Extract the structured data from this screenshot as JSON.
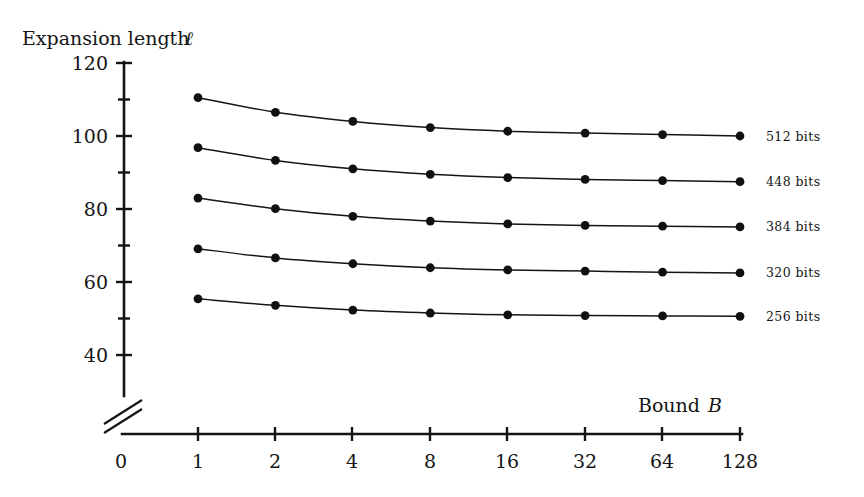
{
  "chart_data": {
    "type": "line",
    "title": "",
    "xlabel": "Bound B",
    "ylabel": "Expansion length ℓ",
    "x_scale": "log2",
    "x": [
      1,
      2,
      4,
      8,
      16,
      32,
      64,
      128
    ],
    "x_tick_labels": [
      "0",
      "1",
      "2",
      "4",
      "8",
      "16",
      "32",
      "64",
      "128"
    ],
    "y_tick_labels": [
      "120",
      "100",
      "80",
      "60",
      "40"
    ],
    "y_major_ticks": [
      40,
      60,
      80,
      100,
      120
    ],
    "y_minor_ticks": [
      50,
      70,
      90,
      110
    ],
    "ylim": [
      36,
      120
    ],
    "axis_break": true,
    "grid": false,
    "legend_position": "right",
    "series": [
      {
        "name": "512 bits",
        "values": [
          110.5,
          106.5,
          104.0,
          102.3,
          101.3,
          100.8,
          100.4,
          100.0
        ]
      },
      {
        "name": "448 bits",
        "values": [
          96.8,
          93.3,
          91.0,
          89.5,
          88.6,
          88.1,
          87.8,
          87.5
        ]
      },
      {
        "name": "384 bits",
        "values": [
          83.0,
          80.1,
          78.0,
          76.7,
          75.9,
          75.5,
          75.3,
          75.1
        ]
      },
      {
        "name": "320 bits",
        "values": [
          69.1,
          66.6,
          65.0,
          63.9,
          63.3,
          63.0,
          62.7,
          62.5
        ]
      },
      {
        "name": "256 bits",
        "values": [
          55.4,
          53.6,
          52.3,
          51.5,
          51.0,
          50.8,
          50.7,
          50.6
        ]
      }
    ]
  },
  "axes": {
    "y_title": "Expansion length ℓ",
    "y_title_text": "Expansion length",
    "y_title_symbol": "ℓ",
    "x_title_text": "Bound",
    "x_title_symbol": "B",
    "y_labels": [
      "120",
      "100",
      "80",
      "60",
      "40"
    ],
    "x_labels": [
      "0",
      "1",
      "2",
      "4",
      "8",
      "16",
      "32",
      "64",
      "128"
    ]
  },
  "legend": {
    "entries": [
      {
        "label": "512 bits"
      },
      {
        "label": "448 bits"
      },
      {
        "label": "384 bits"
      },
      {
        "label": "320 bits"
      },
      {
        "label": "256 bits"
      }
    ]
  },
  "colors": {
    "ink": "#151515",
    "background": "#ffffff",
    "marker": "#101010"
  }
}
